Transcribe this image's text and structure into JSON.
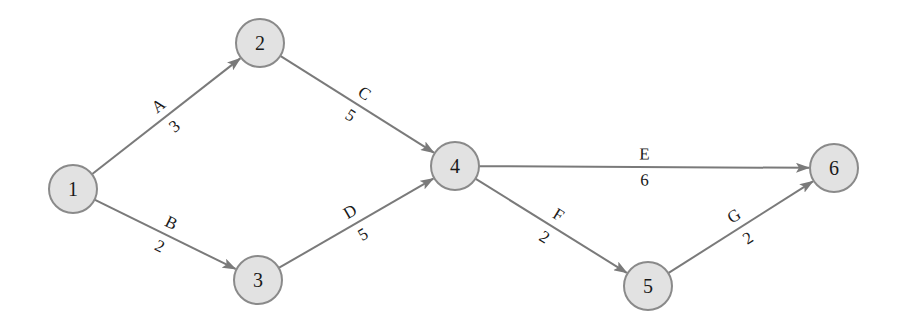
{
  "diagram": {
    "type": "activity-on-arrow network",
    "colors": {
      "node_fill": "#e2e2e2",
      "node_stroke": "#8a8a8a",
      "edge": "#7a7a7a",
      "text": "#1a1a1a"
    },
    "nodes": [
      {
        "id": "1",
        "label": "1",
        "x": 73,
        "y": 189
      },
      {
        "id": "2",
        "label": "2",
        "x": 260,
        "y": 43
      },
      {
        "id": "3",
        "label": "3",
        "x": 258,
        "y": 280
      },
      {
        "id": "4",
        "label": "4",
        "x": 455,
        "y": 166
      },
      {
        "id": "5",
        "label": "5",
        "x": 648,
        "y": 286
      },
      {
        "id": "6",
        "label": "6",
        "x": 834,
        "y": 168
      }
    ],
    "edges": [
      {
        "from": "1",
        "to": "2",
        "activity": "A",
        "duration": "3"
      },
      {
        "from": "1",
        "to": "3",
        "activity": "B",
        "duration": "2"
      },
      {
        "from": "2",
        "to": "4",
        "activity": "C",
        "duration": "5"
      },
      {
        "from": "3",
        "to": "4",
        "activity": "D",
        "duration": "5"
      },
      {
        "from": "4",
        "to": "6",
        "activity": "E",
        "duration": "6"
      },
      {
        "from": "4",
        "to": "5",
        "activity": "F",
        "duration": "2"
      },
      {
        "from": "5",
        "to": "6",
        "activity": "G",
        "duration": "2"
      }
    ]
  }
}
